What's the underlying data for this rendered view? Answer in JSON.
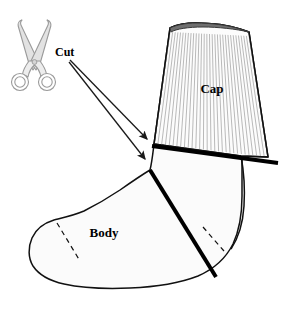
{
  "figure": {
    "kind": "instructional-diagram",
    "background_color": "#ffffff",
    "width": 284,
    "height": 309
  },
  "labels": {
    "cut": "Cut",
    "cap": "Cap",
    "body": "Body"
  },
  "label_positions": {
    "cut": {
      "x": 55,
      "y": 56,
      "size": 12
    },
    "cap": {
      "x": 212,
      "y": 93,
      "size": 13
    },
    "body": {
      "x": 104,
      "y": 237,
      "size": 13
    }
  },
  "colors": {
    "outline": "#111111",
    "sock_fill": "#fbfbfb",
    "cap_fill": "#fcfcfc",
    "rib_line": "#b9b9b9",
    "cuff_edge": "#6f6f6f",
    "cut_line": "#000000",
    "arrow": "#1a1a1a",
    "dashed_seam": "#111111",
    "scissors_fill": "#e2e2e2",
    "scissors_stroke": "#9a9a9a",
    "scissors_handle_fill": "#ededed",
    "text": "#000000"
  },
  "parts": {
    "cap": {
      "name": "Cap",
      "description": "ribbed upper cuff of the sock, above the cut line",
      "rib_count": 30,
      "ribbed": true
    },
    "body": {
      "name": "Body",
      "description": "foot portion of the sock, below the cut lines",
      "seams": [
        "toe-dashed-seam",
        "heel-dashed-seam"
      ]
    }
  },
  "cut_lines": [
    {
      "id": "cut-line-horizontal",
      "label": "Cut",
      "x1": 152,
      "y1": 146,
      "x2": 278,
      "y2": 163,
      "stroke_width": 4
    },
    {
      "id": "cut-line-diagonal",
      "label": "Cut",
      "x1": 150,
      "y1": 170,
      "x2": 216,
      "y2": 277,
      "stroke_width": 4
    }
  ],
  "arrows": [
    {
      "id": "cut-arrow-upper",
      "from_x": 70,
      "from_y": 60,
      "to_x": 147,
      "to_y": 139
    },
    {
      "id": "cut-arrow-lower",
      "from_x": 69,
      "from_y": 62,
      "to_x": 145,
      "to_y": 159
    }
  ],
  "scissors": {
    "name": "scissors-icon",
    "center_x": 34,
    "center_y": 58,
    "blade_tips": [
      {
        "x": 22,
        "y": 20
      },
      {
        "x": 47,
        "y": 20
      }
    ],
    "handle_rings": [
      {
        "cx": 20,
        "cy": 82,
        "r": 8
      },
      {
        "cx": 47,
        "cy": 82,
        "r": 8
      }
    ]
  },
  "geometry": {
    "sock_outline": "M 150,170 C 140,176 130,183 120,190 C 108,198 96,205 84,211 C 72,216 62,218 54,220 C 44,223 36,229 32,238 C 28,247 28,258 33,266 C 39,275 50,281 64,284 C 82,288 106,289 130,288 C 156,287 180,283 198,276 C 214,269 226,258 233,244 C 240,229 242,212 242,196 C 242,182 242,170 242,160 L 241,156 L 154,144 C 153,152 152,162 150,170 Z",
    "cap_outline": "M 170,28 C 176,25 186,23 196,23 C 210,23 228,25 240,29 L 249,32 L 268,157 L 241,156 L 154,144 L 170,28 Z",
    "cuff_top": "M 170,28 C 176,25 186,23 196,23 C 210,23 228,25 240,29 L 249,32 C 236,29 218,27 203,27 C 188,27 176,29 171,32 Z",
    "toe_seam": {
      "x1": 57,
      "y1": 223,
      "x2": 80,
      "y2": 261
    },
    "heel_seam": {
      "x1": 203,
      "y1": 227,
      "x2": 224,
      "y2": 251
    },
    "ankle_back_curve": "M 241,156 C 244,172 245,190 244,206 C 243,222 239,237 231,249"
  }
}
